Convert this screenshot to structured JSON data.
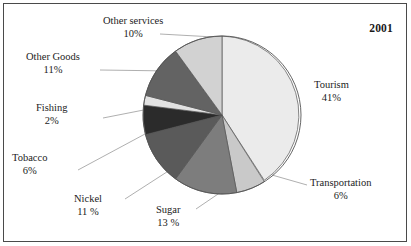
{
  "year_label": "2001",
  "chart_data": {
    "type": "pie",
    "title": "2001",
    "xlabel": "",
    "ylabel": "",
    "legend_position": "none",
    "grid": false,
    "start_angle_deg": 0,
    "direction": "clockwise",
    "categories": [
      "Tourism",
      "Transportation",
      "Sugar",
      "Nickel",
      "Tobacco",
      "Fishing",
      "Other Goods",
      "Other services"
    ],
    "values": [
      41,
      6,
      13,
      11,
      6,
      2,
      11,
      10
    ],
    "value_labels": [
      "41%",
      "6%",
      "13 %",
      "11 %",
      "6%",
      "2%",
      "11%",
      "10%"
    ],
    "unit": "%",
    "colors": [
      "#ebebeb",
      "#c9c9c9",
      "#7d7d7d",
      "#5a5a5a",
      "#2b2b2b",
      "#e2e2e2",
      "#636363",
      "#d2d2d2"
    ],
    "slices": [
      {
        "name": "Tourism",
        "value": 41,
        "value_label": "41%",
        "color": "#ebebeb"
      },
      {
        "name": "Transportation",
        "value": 6,
        "value_label": "6%",
        "color": "#c9c9c9"
      },
      {
        "name": "Sugar",
        "value": 13,
        "value_label": "13 %",
        "color": "#7d7d7d"
      },
      {
        "name": "Nickel",
        "value": 11,
        "value_label": "11 %",
        "color": "#5a5a5a"
      },
      {
        "name": "Tobacco",
        "value": 6,
        "value_label": "6%",
        "color": "#2b2b2b"
      },
      {
        "name": "Fishing",
        "value": 2,
        "value_label": "2%",
        "color": "#e2e2e2"
      },
      {
        "name": "Other Goods",
        "value": 11,
        "value_label": "11%",
        "color": "#636363"
      },
      {
        "name": "Other services",
        "value": 10,
        "value_label": "10%",
        "color": "#d2d2d2"
      }
    ]
  },
  "labels": {
    "tourism": {
      "name": "Tourism",
      "pct": "41%"
    },
    "transportation": {
      "name": "Transportation",
      "pct": "6%"
    },
    "sugar": {
      "name": "Sugar",
      "pct": "13 %"
    },
    "nickel": {
      "name": "Nickel",
      "pct": "11 %"
    },
    "tobacco": {
      "name": "Tobacco",
      "pct": "6%"
    },
    "fishing": {
      "name": "Fishing",
      "pct": "2%"
    },
    "other_goods": {
      "name": "Other Goods",
      "pct": "11%"
    },
    "other_services": {
      "name": "Other services",
      "pct": "10%"
    }
  },
  "style": {
    "frame_color": "#4a4a4a",
    "background": "#ffffff",
    "text_color": "#1c1c1c",
    "leader_line_color": "#9a9a9a",
    "pie_outline_color": "#555555"
  }
}
